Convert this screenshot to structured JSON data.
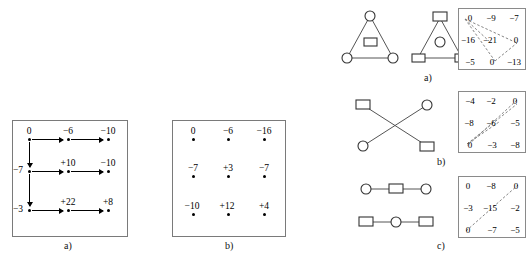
{
  "figure": {
    "left_panel_a": {
      "caption": "a)",
      "grid_labels": [
        [
          "0",
          "−6",
          "−10"
        ],
        [
          "−7",
          "+10",
          "−10"
        ],
        [
          "−3",
          "+22",
          "+8"
        ]
      ],
      "horizontal_arrows": 6,
      "vertical_arrows": 2
    },
    "left_panel_b": {
      "caption": "b)",
      "grid_labels": [
        [
          "0",
          "−6",
          "−16"
        ],
        [
          "−7",
          "+3",
          "−7"
        ],
        [
          "−10",
          "+12",
          "+4"
        ]
      ]
    },
    "rows": [
      {
        "caption": "a)",
        "graphs": [
          {
            "name": "triangle-circles",
            "shape": "triangle",
            "apex": "circle",
            "bottom_left": "circle",
            "bottom_right": "circle",
            "inner": "square"
          },
          {
            "name": "triangle-squares",
            "shape": "triangle",
            "apex": "square",
            "bottom_left": "square",
            "bottom_right": "square",
            "inner": "circle"
          }
        ],
        "matrix": [
          [
            "0",
            "−9",
            "−7"
          ],
          [
            "−16",
            "−21",
            "0"
          ],
          [
            "−5",
            "0",
            "−13"
          ]
        ],
        "dash_pattern": "triangle"
      },
      {
        "caption": "b)",
        "graphs": [
          {
            "name": "cross-pairs",
            "shape": "cross",
            "top_left": "square",
            "top_right": "circle",
            "bottom_left": "circle",
            "bottom_right": "square"
          }
        ],
        "matrix": [
          [
            "−4",
            "−2",
            "0"
          ],
          [
            "−8",
            "−6",
            "−5"
          ],
          [
            "0",
            "−3",
            "−8"
          ]
        ],
        "dash_pattern": "cross"
      },
      {
        "caption": "c)",
        "graphs": [
          {
            "name": "path-circle-square-circle",
            "shape": "path",
            "left": "circle",
            "middle": "square",
            "right": "circle"
          },
          {
            "name": "path-square-circle-square",
            "shape": "path",
            "left": "square",
            "middle": "circle",
            "right": "square"
          }
        ],
        "matrix": [
          [
            "0",
            "−8",
            "0"
          ],
          [
            "−3",
            "−15",
            "−2"
          ],
          [
            "0",
            "−7",
            "−5"
          ]
        ],
        "dash_pattern": "diagonal"
      }
    ]
  },
  "colors": {
    "ink": "#000000",
    "box_border": "#7a7a7a",
    "graph_stroke": "#555555",
    "dash_stroke": "#777777",
    "background": "#ffffff"
  }
}
